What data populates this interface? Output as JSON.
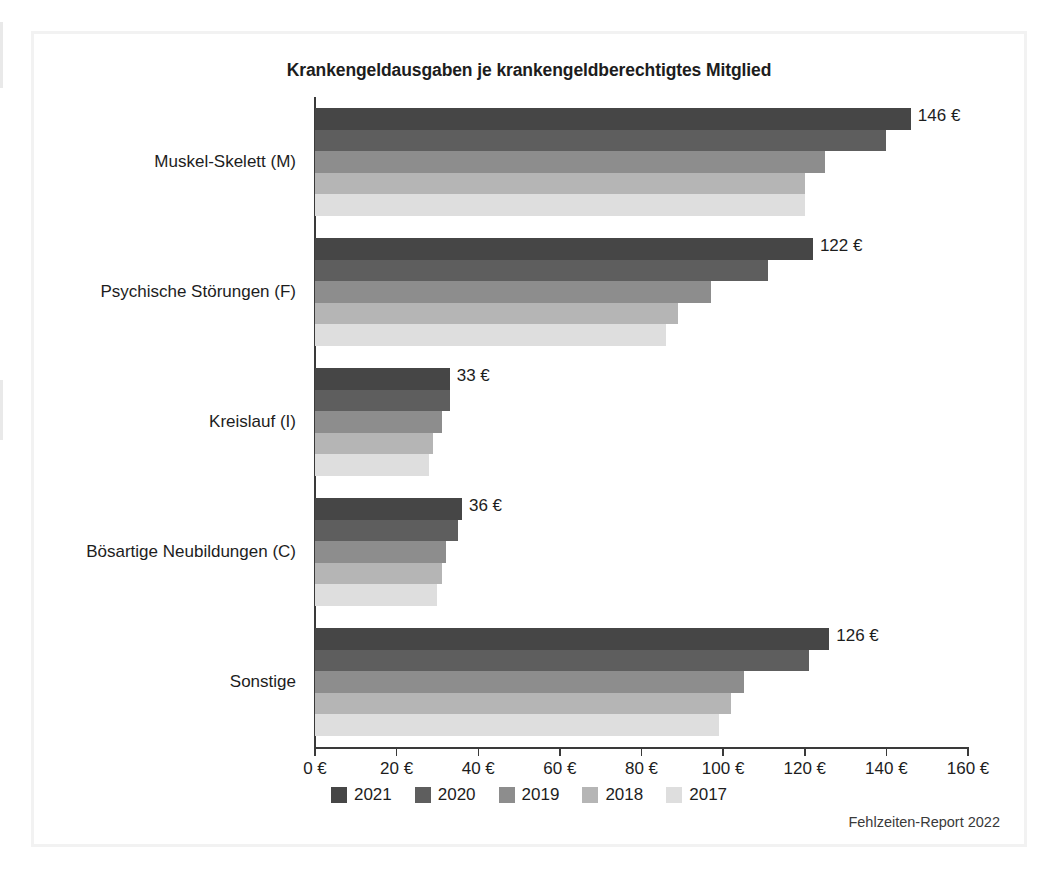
{
  "figure": {
    "source_note": "Fehlzeiten-Report 2022"
  },
  "chart_data": {
    "type": "bar",
    "orientation": "horizontal",
    "title": "Krankengeldausgaben je krankengeldberechtigtes Mitglied",
    "xlabel": "",
    "ylabel": "",
    "xlim": [
      0,
      160
    ],
    "xtick_step": 20,
    "xtick_labels": [
      "0 €",
      "20 €",
      "40 €",
      "60 €",
      "80 €",
      "100 €",
      "120 €",
      "140 €",
      "160 €"
    ],
    "xtick_values": [
      0,
      20,
      40,
      60,
      80,
      100,
      120,
      140,
      160
    ],
    "grid": false,
    "legend_position": "bottom",
    "unit": "€",
    "categories": [
      "Muskel-Skelett (M)",
      "Psychische Störungen (F)",
      "Kreislauf (I)",
      "Bösartige Neubildungen (C)",
      "Sonstige"
    ],
    "series": [
      {
        "name": "2021",
        "color": "#464646",
        "values": [
          146,
          122,
          33,
          36,
          126
        ]
      },
      {
        "name": "2020",
        "color": "#5e5e5e",
        "values": [
          140,
          111,
          33,
          35,
          121
        ]
      },
      {
        "name": "2019",
        "color": "#8d8d8d",
        "values": [
          125,
          97,
          31,
          32,
          105
        ]
      },
      {
        "name": "2018",
        "color": "#b5b5b5",
        "values": [
          120,
          89,
          29,
          31,
          102
        ]
      },
      {
        "name": "2017",
        "color": "#dedede",
        "values": [
          120,
          86,
          28,
          30,
          99
        ]
      }
    ],
    "data_labels": {
      "series": "2021",
      "values": [
        "146 €",
        "122 €",
        "33 €",
        "36 €",
        "126 €"
      ]
    }
  }
}
